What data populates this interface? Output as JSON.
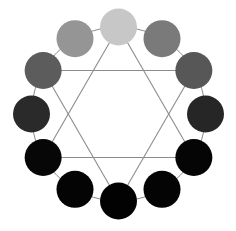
{
  "diagram": {
    "title": "",
    "swatches": [
      {
        "position": 1,
        "color": "#c7c7c7"
      },
      {
        "position": 2,
        "color": "#7a7a7a"
      },
      {
        "position": 3,
        "color": "#575757"
      },
      {
        "position": 4,
        "color": "#262626"
      },
      {
        "position": 5,
        "color": "#050505"
      },
      {
        "position": 6,
        "color": "#040404"
      },
      {
        "position": 7,
        "color": "#020202"
      },
      {
        "position": 8,
        "color": "#040404"
      },
      {
        "position": 9,
        "color": "#070707"
      },
      {
        "position": 10,
        "color": "#2a2a2a"
      },
      {
        "position": 11,
        "color": "#5c5c5c"
      },
      {
        "position": 12,
        "color": "#959595"
      }
    ],
    "triangles": [
      {
        "vertices": [
          1,
          5,
          9
        ]
      },
      {
        "vertices": [
          3,
          7,
          11
        ]
      },
      {
        "vertices": [
          12,
          4,
          8
        ],
        "note": "horizontal lines link 12-4 and 10-6 pairs"
      }
    ],
    "horizontal_links": [
      [
        11,
        3
      ],
      [
        10,
        4
      ]
    ],
    "line_color": "#8c8c8c"
  }
}
